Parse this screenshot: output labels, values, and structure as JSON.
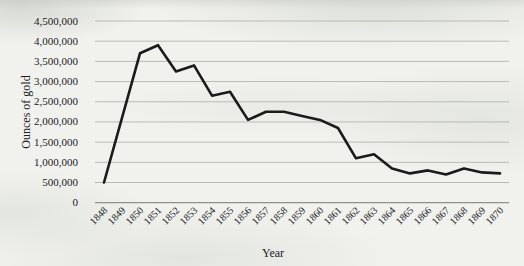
{
  "figure": {
    "kind": "scanned-book-line-chart",
    "x_axis_title": "Year",
    "y_axis_title": "Ounces of gold"
  },
  "chart_data": {
    "type": "line",
    "title": "",
    "xlabel": "Year",
    "ylabel": "Ounces of gold",
    "categories": [
      "1848",
      "1849",
      "1850",
      "1851",
      "1852",
      "1853",
      "1854",
      "1855",
      "1856",
      "1857",
      "1858",
      "1859",
      "1860",
      "1861",
      "1862",
      "1863",
      "1864",
      "1865",
      "1866",
      "1867",
      "1868",
      "1869",
      "1870"
    ],
    "values": [
      500000,
      2100000,
      3700000,
      3900000,
      3250000,
      3400000,
      2650000,
      2750000,
      2050000,
      2250000,
      2250000,
      2150000,
      2050000,
      1850000,
      1100000,
      1200000,
      850000,
      725000,
      800000,
      700000,
      850000,
      750000,
      725000
    ],
    "ylim": [
      0,
      4500000
    ],
    "ytick_step": 500000,
    "grid": "horizontal-only",
    "legend": "none",
    "colors": {
      "line": "#1b1b1b",
      "gridline": "#b9bcb2",
      "axis_line": "#8f928a",
      "labels": "#20201e",
      "paper": "#f1f2ee"
    }
  }
}
